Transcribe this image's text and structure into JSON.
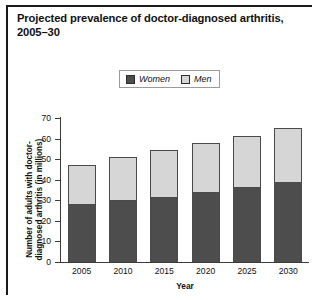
{
  "figure": {
    "title": "Projected prevalence of doctor-diagnosed arthritis, 2005–30"
  },
  "legend": {
    "entries": [
      {
        "label": "Women",
        "color": "#4d4d4d",
        "icon": "legend-swatch-women"
      },
      {
        "label": "Men",
        "color": "#d6d6d6",
        "icon": "legend-swatch-men"
      }
    ]
  },
  "axes": {
    "y": {
      "label": "Number of adults with doctor-diagnosed arthritis (in millions)",
      "ticks": [
        "0",
        "10",
        "20",
        "30",
        "40",
        "50",
        "60",
        "70"
      ]
    },
    "x": {
      "label": "Year",
      "ticks": [
        "2005",
        "2010",
        "2015",
        "2020",
        "2025",
        "2030"
      ]
    }
  },
  "chart_data": {
    "type": "bar",
    "stacked": true,
    "title": "Projected prevalence of doctor-diagnosed arthritis, 2005–30",
    "xlabel": "Year",
    "ylabel": "Number of adults with doctor-diagnosed arthritis (in millions)",
    "categories": [
      "2005",
      "2010",
      "2015",
      "2020",
      "2025",
      "2030"
    ],
    "series": [
      {
        "name": "Women",
        "color": "#4d4d4d",
        "values": [
          28,
          30,
          31.5,
          34,
          36.5,
          39
        ]
      },
      {
        "name": "Men",
        "color": "#d6d6d6",
        "values": [
          19,
          21,
          23,
          24,
          25,
          26
        ]
      }
    ],
    "totals": [
      47,
      51,
      54.5,
      58,
      61.5,
      65
    ],
    "ylim": [
      0,
      70
    ],
    "ytick_step": 10,
    "grid": false,
    "legend_position": "top-center"
  }
}
